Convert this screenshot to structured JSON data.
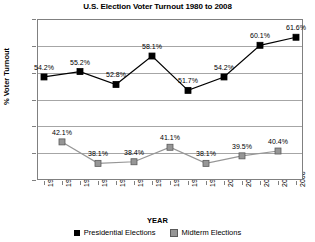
{
  "chart_data": {
    "type": "line",
    "title": "U.S. Election Voter Turnout 1980 to 2008",
    "xlabel": "YEAR",
    "ylabel": "% Voter Turnout",
    "ylim": [
      35,
      65
    ],
    "ytick_labels": [
      "65%",
      "60%",
      "55%",
      "50%",
      "45%",
      "40%",
      "35%"
    ],
    "ytick_values": [
      65,
      60,
      55,
      50,
      45,
      40,
      35
    ],
    "grid": true,
    "legend_position": "bottom",
    "x": [
      1980,
      1982,
      1984,
      1986,
      1988,
      1990,
      1992,
      1994,
      1996,
      1998,
      2000,
      2002,
      2004,
      2006,
      2008
    ],
    "xtick_labels": [
      "1980",
      "1982",
      "1984",
      "1986",
      "1988",
      "1990",
      "1992",
      "1994",
      "1996",
      "1998",
      "2000",
      "2002",
      "2004",
      "2006",
      "2008"
    ],
    "series": [
      {
        "name": "Presidential Elections",
        "color": "#000000",
        "marker": "square",
        "x": [
          1980,
          1984,
          1988,
          1992,
          1996,
          2000,
          2004,
          2008
        ],
        "values": [
          54.2,
          55.2,
          52.8,
          58.1,
          51.7,
          54.2,
          60.1,
          61.6
        ],
        "labels": [
          "54.2%",
          "55.2%",
          "52.8%",
          "58.1%",
          "51.7%",
          "54.2%",
          "60.1%",
          "61.6%"
        ]
      },
      {
        "name": "Midterm Elections",
        "color": "#969696",
        "marker": "square",
        "x": [
          1982,
          1986,
          1990,
          1994,
          1998,
          2002,
          2006
        ],
        "values": [
          42.1,
          38.1,
          38.4,
          41.1,
          38.1,
          39.5,
          40.4
        ],
        "labels": [
          "42.1%",
          "38.1%",
          "38.4%",
          "41.1%",
          "38.1%",
          "39.5%",
          "40.4%"
        ]
      }
    ]
  }
}
